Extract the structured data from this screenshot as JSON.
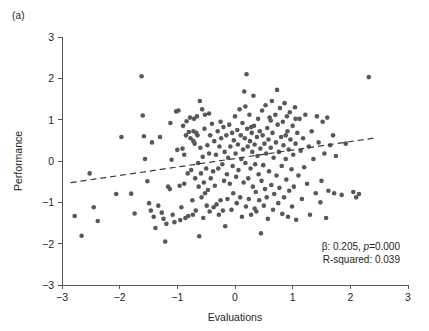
{
  "panel": {
    "label": "(a)"
  },
  "annotations": {
    "beta_prefix": "β: 0.205, ",
    "p_italic": "p",
    "p_value": "=0.000",
    "r_squared": "R-squared: 0.039"
  },
  "colors": {
    "point": "#58585b",
    "axis": "#58585b",
    "fitline": "#3a3a3c",
    "text": "#231f20",
    "background": "#ffffff"
  },
  "chart_data": {
    "type": "scatter",
    "title": "",
    "xlabel": "Evaluations",
    "ylabel": "Performance",
    "xlim": [
      -3,
      3
    ],
    "ylim": [
      -3,
      3
    ],
    "xticks": [
      -3,
      -2,
      -1,
      0,
      1,
      2,
      3
    ],
    "yticks": [
      -3,
      -2,
      -1,
      0,
      1,
      2,
      3
    ],
    "xticklabels": [
      "−3",
      "−2",
      "−1",
      "0",
      "1",
      "2",
      "3"
    ],
    "yticklabels": [
      "−3",
      "−2",
      "−1",
      "0",
      "1",
      "2",
      "3"
    ],
    "grid": false,
    "legend": null,
    "marker": {
      "shape": "circle",
      "size_px": 4.6,
      "color": "#58585b"
    },
    "fit": {
      "type": "linear",
      "style": "dashed",
      "slope": 0.205,
      "intercept": 0.06,
      "x_start": -2.85,
      "x_end": 2.45,
      "y_start": -0.524,
      "y_end": 0.562
    },
    "statistics": {
      "beta": 0.205,
      "p_value": 0.0,
      "r_squared": 0.039
    },
    "n_points": 252,
    "points": [
      [
        -2.78,
        -1.33
      ],
      [
        -2.66,
        -1.81
      ],
      [
        -2.52,
        -0.3
      ],
      [
        -2.45,
        -1.12
      ],
      [
        -2.38,
        -1.45
      ],
      [
        -2.06,
        -0.8
      ],
      [
        -1.97,
        0.58
      ],
      [
        -1.8,
        -0.79
      ],
      [
        -1.74,
        -1.27
      ],
      [
        -1.62,
        2.05
      ],
      [
        -1.6,
        1.1
      ],
      [
        -1.58,
        0.6
      ],
      [
        -1.56,
        0.05
      ],
      [
        -1.52,
        -0.49
      ],
      [
        -1.49,
        -1.02
      ],
      [
        -1.46,
        -1.2
      ],
      [
        -1.44,
        0.45
      ],
      [
        -1.41,
        -1.35
      ],
      [
        -1.38,
        -1.62
      ],
      [
        -1.33,
        -1.08
      ],
      [
        -1.3,
        0.58
      ],
      [
        -1.27,
        -1.25
      ],
      [
        -1.24,
        -1.4
      ],
      [
        -1.21,
        -1.95
      ],
      [
        -1.19,
        -1.52
      ],
      [
        -1.16,
        -0.62
      ],
      [
        -1.13,
        -0.68
      ],
      [
        -1.1,
        0.03
      ],
      [
        -1.08,
        -1.3
      ],
      [
        -1.05,
        -1.48
      ],
      [
        -1.02,
        1.2
      ],
      [
        -1.0,
        0.27
      ],
      [
        -0.98,
        1.22
      ],
      [
        -0.96,
        -0.6
      ],
      [
        -0.95,
        -1.43
      ],
      [
        -0.93,
        -1.12
      ],
      [
        -0.91,
        0.3
      ],
      [
        -0.9,
        0.85
      ],
      [
        -0.88,
        -0.55
      ],
      [
        -0.86,
        -1.38
      ],
      [
        -0.85,
        0.62
      ],
      [
        -0.84,
        0.96
      ],
      [
        -0.82,
        -0.3
      ],
      [
        -0.81,
        -1.33
      ],
      [
        -0.8,
        0.7
      ],
      [
        -0.78,
        1.05
      ],
      [
        -0.77,
        0.55
      ],
      [
        -0.76,
        -0.22
      ],
      [
        -0.74,
        -0.95
      ],
      [
        -0.73,
        -1.3
      ],
      [
        -0.72,
        0.72
      ],
      [
        -0.71,
        1.02
      ],
      [
        -0.7,
        0.42
      ],
      [
        -0.69,
        -0.42
      ],
      [
        -0.68,
        -1.2
      ],
      [
        -0.67,
        0.68
      ],
      [
        -0.66,
        1.08
      ],
      [
        -0.65,
        0.62
      ],
      [
        -0.64,
        -0.05
      ],
      [
        -0.63,
        -0.62
      ],
      [
        -0.62,
        -1.82
      ],
      [
        -0.61,
        1.45
      ],
      [
        -0.6,
        0.32
      ],
      [
        -0.59,
        -0.3
      ],
      [
        -0.58,
        -0.88
      ],
      [
        -0.57,
        1.25
      ],
      [
        -0.56,
        0.1
      ],
      [
        -0.55,
        -1.38
      ],
      [
        -0.54,
        -0.52
      ],
      [
        -0.53,
        0.78
      ],
      [
        -0.52,
        1.12
      ],
      [
        -0.5,
        -0.18
      ],
      [
        -0.49,
        -1.08
      ],
      [
        -0.48,
        0.38
      ],
      [
        -0.47,
        -0.7
      ],
      [
        -0.45,
        0.18
      ],
      [
        -0.44,
        -1.22
      ],
      [
        -0.43,
        0.62
      ],
      [
        -0.42,
        -0.42
      ],
      [
        -0.4,
        0.9
      ],
      [
        -0.38,
        -0.25
      ],
      [
        -0.37,
        -1.12
      ],
      [
        -0.36,
        0.48
      ],
      [
        -0.35,
        -0.6
      ],
      [
        -0.33,
        0.15
      ],
      [
        -0.32,
        -1.05
      ],
      [
        -0.3,
        0.72
      ],
      [
        -0.29,
        -0.18
      ],
      [
        -0.28,
        -1.3
      ],
      [
        -0.27,
        0.35
      ],
      [
        -0.25,
        -0.95
      ],
      [
        -0.24,
        0.55
      ],
      [
        -0.22,
        -0.08
      ],
      [
        -0.21,
        -1.2
      ],
      [
        -0.2,
        0.82
      ],
      [
        -0.19,
        -0.48
      ],
      [
        -0.18,
        0.22
      ],
      [
        -0.17,
        -1.58
      ],
      [
        -0.15,
        0.62
      ],
      [
        -0.14,
        -0.32
      ],
      [
        -0.13,
        -0.92
      ],
      [
        -0.12,
        0.08
      ],
      [
        -0.1,
        0.88
      ],
      [
        -0.09,
        -0.55
      ],
      [
        -0.08,
        0.35
      ],
      [
        -0.06,
        -1.18
      ],
      [
        -0.05,
        0.68
      ],
      [
        -0.04,
        -0.12
      ],
      [
        -0.03,
        -0.78
      ],
      [
        -0.02,
        0.5
      ],
      [
        0.0,
        1.08
      ],
      [
        0.01,
        0.18
      ],
      [
        0.02,
        -0.38
      ],
      [
        0.03,
        -1.02
      ],
      [
        0.04,
        0.75
      ],
      [
        0.05,
        0.4
      ],
      [
        0.06,
        -0.22
      ],
      [
        0.08,
        1.25
      ],
      [
        0.09,
        -0.88
      ],
      [
        0.1,
        0.62
      ],
      [
        0.11,
        0.05
      ],
      [
        0.12,
        -1.35
      ],
      [
        0.13,
        0.92
      ],
      [
        0.14,
        0.28
      ],
      [
        0.15,
        -0.52
      ],
      [
        0.16,
        1.68
      ],
      [
        0.17,
        0.55
      ],
      [
        0.18,
        -0.05
      ],
      [
        0.19,
        -1.1
      ],
      [
        0.2,
        2.1
      ],
      [
        0.21,
        0.78
      ],
      [
        0.22,
        0.35
      ],
      [
        0.23,
        -0.42
      ],
      [
        0.24,
        -0.92
      ],
      [
        0.25,
        1.12
      ],
      [
        0.26,
        0.48
      ],
      [
        0.27,
        -0.18
      ],
      [
        0.28,
        -1.3
      ],
      [
        0.29,
        0.68
      ],
      [
        0.3,
        0.22
      ],
      [
        0.31,
        -0.62
      ],
      [
        0.32,
        1.58
      ],
      [
        0.33,
        0.85
      ],
      [
        0.34,
        0.4
      ],
      [
        0.35,
        -0.08
      ],
      [
        0.36,
        -0.75
      ],
      [
        0.37,
        -1.22
      ],
      [
        0.38,
        0.58
      ],
      [
        0.39,
        0.12
      ],
      [
        0.4,
        1.02
      ],
      [
        0.41,
        -0.32
      ],
      [
        0.42,
        -0.95
      ],
      [
        0.43,
        0.72
      ],
      [
        0.44,
        0.3
      ],
      [
        0.45,
        -1.75
      ],
      [
        0.46,
        -0.48
      ],
      [
        0.47,
        1.22
      ],
      [
        0.48,
        0.62
      ],
      [
        0.49,
        -0.1
      ],
      [
        0.5,
        -1.08
      ],
      [
        0.51,
        0.42
      ],
      [
        0.52,
        -0.68
      ],
      [
        0.53,
        1.35
      ],
      [
        0.54,
        0.18
      ],
      [
        0.55,
        -0.88
      ],
      [
        0.56,
        0.8
      ],
      [
        0.57,
        -1.4
      ],
      [
        0.58,
        0.52
      ],
      [
        0.59,
        -0.25
      ],
      [
        0.6,
        1.05
      ],
      [
        0.62,
        0.32
      ],
      [
        0.63,
        -0.58
      ],
      [
        0.64,
        1.45
      ],
      [
        0.65,
        0.68
      ],
      [
        0.66,
        -1.18
      ],
      [
        0.67,
        0.08
      ],
      [
        0.68,
        -0.8
      ],
      [
        0.7,
        1.12
      ],
      [
        0.71,
        0.45
      ],
      [
        0.72,
        -0.35
      ],
      [
        0.73,
        1.72
      ],
      [
        0.74,
        0.88
      ],
      [
        0.75,
        -1.02
      ],
      [
        0.76,
        0.22
      ],
      [
        0.77,
        -0.65
      ],
      [
        0.78,
        1.28
      ],
      [
        0.8,
        0.58
      ],
      [
        0.81,
        -0.12
      ],
      [
        0.82,
        -1.28
      ],
      [
        0.83,
        0.95
      ],
      [
        0.84,
        0.38
      ],
      [
        0.85,
        -0.88
      ],
      [
        0.86,
        1.4
      ],
      [
        0.88,
        0.05
      ],
      [
        0.89,
        -0.45
      ],
      [
        0.9,
        1.08
      ],
      [
        0.91,
        0.72
      ],
      [
        0.92,
        -1.35
      ],
      [
        0.93,
        0.28
      ],
      [
        0.94,
        -0.72
      ],
      [
        0.95,
        1.18
      ],
      [
        0.96,
        0.52
      ],
      [
        0.98,
        -0.2
      ],
      [
        0.99,
        -1.1
      ],
      [
        1.0,
        0.85
      ],
      [
        1.01,
        0.15
      ],
      [
        1.02,
        -0.62
      ],
      [
        1.04,
        1.3
      ],
      [
        1.05,
        0.42
      ],
      [
        1.06,
        -1.42
      ],
      [
        1.08,
        0.68
      ],
      [
        1.1,
        -0.35
      ],
      [
        1.12,
        1.02
      ],
      [
        1.14,
        0.25
      ],
      [
        1.16,
        -0.92
      ],
      [
        1.18,
        0.55
      ],
      [
        1.2,
        -0.15
      ],
      [
        1.22,
        1.12
      ],
      [
        1.25,
        -0.55
      ],
      [
        1.28,
        0.35
      ],
      [
        1.3,
        -1.3
      ],
      [
        1.33,
        0.72
      ],
      [
        1.36,
        0.05
      ],
      [
        1.4,
        -0.78
      ],
      [
        1.42,
        1.08
      ],
      [
        1.45,
        0.45
      ],
      [
        1.48,
        -1.0
      ],
      [
        1.5,
        -0.48
      ],
      [
        1.52,
        0.95
      ],
      [
        1.55,
        0.18
      ],
      [
        1.58,
        -1.38
      ],
      [
        1.6,
        1.05
      ],
      [
        1.62,
        -0.72
      ],
      [
        1.65,
        0.38
      ],
      [
        1.7,
        0.62
      ],
      [
        1.72,
        -0.78
      ],
      [
        1.75,
        0.12
      ],
      [
        1.85,
        -0.82
      ],
      [
        1.92,
        0.42
      ],
      [
        2.05,
        -0.75
      ],
      [
        2.1,
        -0.88
      ],
      [
        2.15,
        -0.8
      ],
      [
        2.32,
        2.03
      ],
      [
        -0.45,
        1.15
      ],
      [
        -1.12,
        0.92
      ],
      [
        0.62,
        0.98
      ],
      [
        0.28,
        0.82
      ],
      [
        -0.25,
        0.95
      ],
      [
        0.88,
        0.62
      ],
      [
        -0.72,
        0.48
      ],
      [
        0.34,
        -1.15
      ],
      [
        -0.88,
        0.15
      ],
      [
        1.05,
        1.02
      ],
      [
        0.18,
        1.32
      ],
      [
        -0.52,
        -0.78
      ]
    ]
  }
}
